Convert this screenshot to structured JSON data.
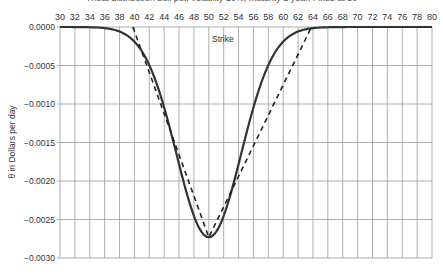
{
  "chart_data": {
    "type": "line",
    "title": "Theta distribution bull put, volatility 10%, maturity 1 year, Fixed at 50",
    "xlabel": "Strike",
    "ylabel": "θ in Dollars per day",
    "x_ticks": [
      30,
      32,
      34,
      36,
      38,
      40,
      42,
      44,
      46,
      48,
      50,
      52,
      54,
      56,
      58,
      60,
      62,
      64,
      66,
      68,
      70,
      72,
      74,
      76,
      78,
      80
    ],
    "y_ticks": [
      "0.0000",
      "-0.0005",
      "-0.0010",
      "-0.0015",
      "-0.0020",
      "-0.0025",
      "-0.0030"
    ],
    "xlim": [
      30,
      80
    ],
    "ylim": [
      -0.003,
      0.0
    ],
    "grid": true,
    "x_axis_position": "top",
    "series": [
      {
        "name": "Theta (solid)",
        "style": "solid",
        "x": [
          30,
          32,
          34,
          36,
          38,
          40,
          42,
          44,
          46,
          48,
          50,
          52,
          54,
          56,
          58,
          60,
          62,
          64,
          66,
          68,
          70,
          72,
          74,
          76,
          78,
          80
        ],
        "values": [
          0.0,
          0.0,
          -1e-05,
          -1e-05,
          -5e-05,
          -0.00016,
          -0.00049,
          -0.00104,
          -0.0018,
          -0.00245,
          -0.00273,
          -0.00245,
          -0.0018,
          -0.00104,
          -0.00049,
          -0.00016,
          -5e-05,
          -1e-05,
          0.0,
          0.0,
          0.0,
          0.0,
          0.0,
          0.0,
          0.0,
          0.0
        ]
      },
      {
        "name": "Theta approximation (dashed)",
        "style": "dashed",
        "x": [
          39.8,
          50,
          63.8
        ],
        "values": [
          0.0,
          -0.00273,
          0.0
        ]
      }
    ]
  }
}
